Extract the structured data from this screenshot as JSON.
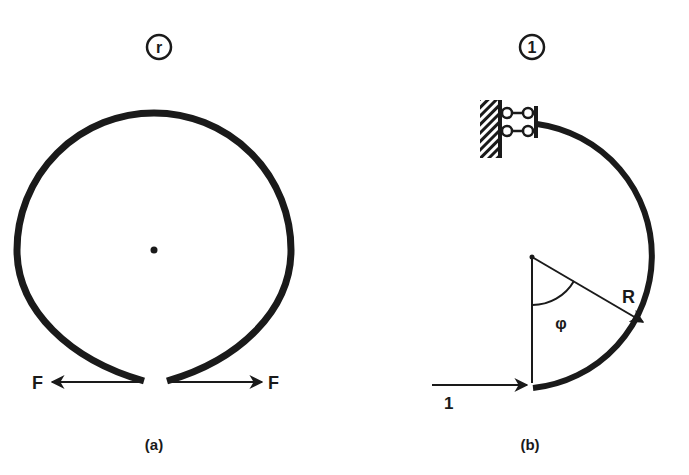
{
  "figure": {
    "panel_a": {
      "caption": "(a)",
      "tag_symbol": "r",
      "force_left_label": "F",
      "force_right_label": "F",
      "description": "Open circular ring with gap at bottom, opposing forces F applied at the gap ends"
    },
    "panel_b": {
      "caption": "(b)",
      "tag_symbol": "1",
      "radius_label": "R",
      "angle_label": "φ",
      "unit_load_label": "1",
      "description": "Half ring clamped by sliding support at top, unit load applied horizontally at bottom end"
    },
    "colors": {
      "ink": "#1a1a1a",
      "background": "#ffffff"
    }
  }
}
